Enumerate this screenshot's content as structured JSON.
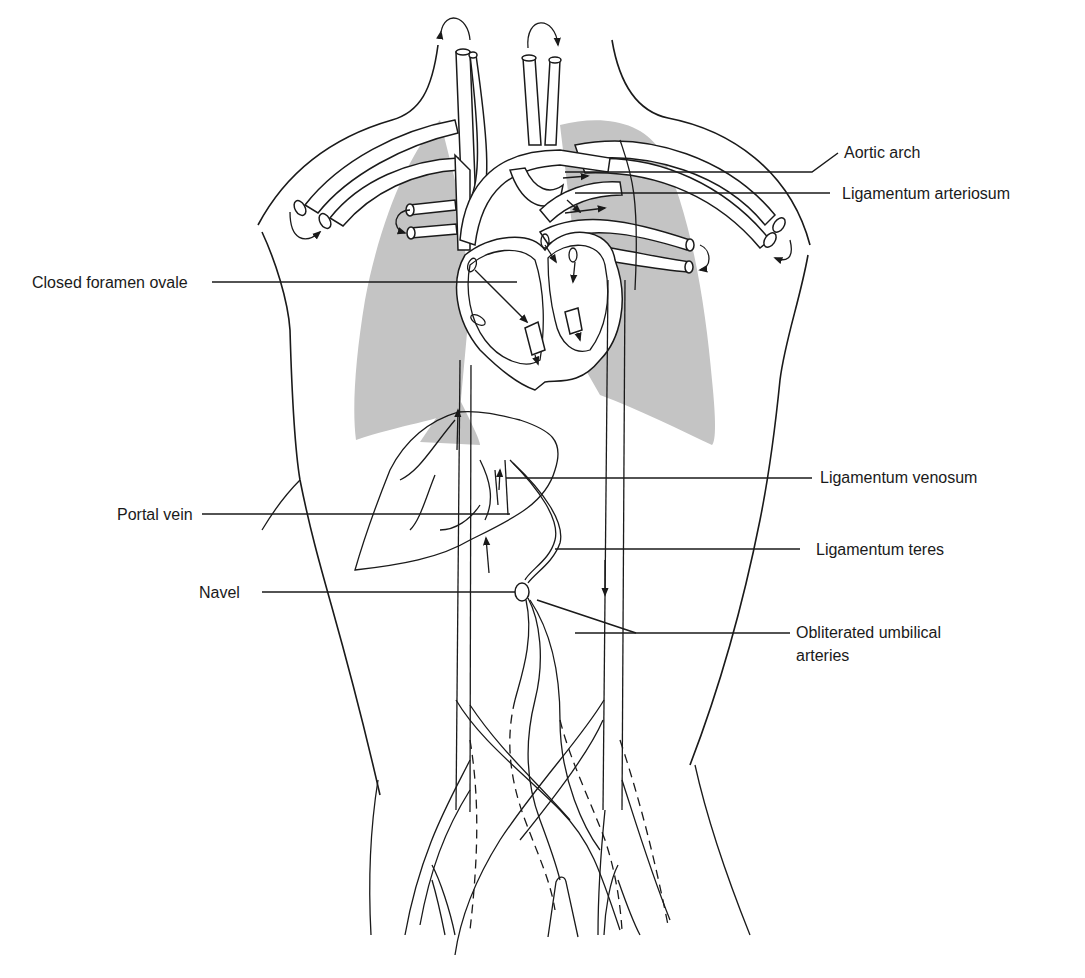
{
  "figure": {
    "colors": {
      "line": "#1a1a1a",
      "lung_shade": "#c4c4c4",
      "background": "#ffffff"
    },
    "labels": {
      "aortic_arch": "Aortic arch",
      "ligamentum_arteriosum": "Ligamentum arteriosum",
      "closed_foramen_ovale": "Closed foramen ovale",
      "ligamentum_venosum": "Ligamentum venosum",
      "portal_vein": "Portal vein",
      "ligamentum_teres": "Ligamentum teres",
      "navel": "Navel",
      "obliterated_umbilical_arteries_line1": "Obliterated umbilical",
      "obliterated_umbilical_arteries_line2": "arteries"
    }
  }
}
